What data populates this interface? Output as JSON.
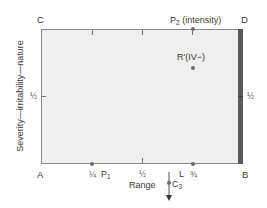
{
  "diagram": {
    "corners": {
      "top_left": "C",
      "top_right": "D",
      "bottom_left": "A",
      "bottom_right": "B"
    },
    "x_axis": {
      "label": "Range",
      "ticks": [
        "¼",
        "½",
        "¾"
      ]
    },
    "y_axis": {
      "label": "Severity—irritability—nature",
      "ticks_left": [
        "½"
      ],
      "ticks_right": [
        "½"
      ]
    },
    "points": {
      "p1": {
        "name": "P",
        "sub": "1",
        "x": 0.25,
        "y": 0
      },
      "p2": {
        "name": "P",
        "sub": "2",
        "suffix": "(intensity)",
        "x": 0.75,
        "y": 1
      },
      "r_prime": {
        "label": "R'(IV−)",
        "x": 0.75,
        "y": 0.75
      },
      "l": {
        "label": "L",
        "x": 0.75,
        "y": 0
      },
      "c3": {
        "name": "C",
        "sub": "3",
        "direction": "down"
      }
    },
    "colors": {
      "plot_fill": "#efefef",
      "border": "#8a8a8a",
      "right_bar": "#5a5a5a",
      "points": "#6a6a6a"
    }
  }
}
